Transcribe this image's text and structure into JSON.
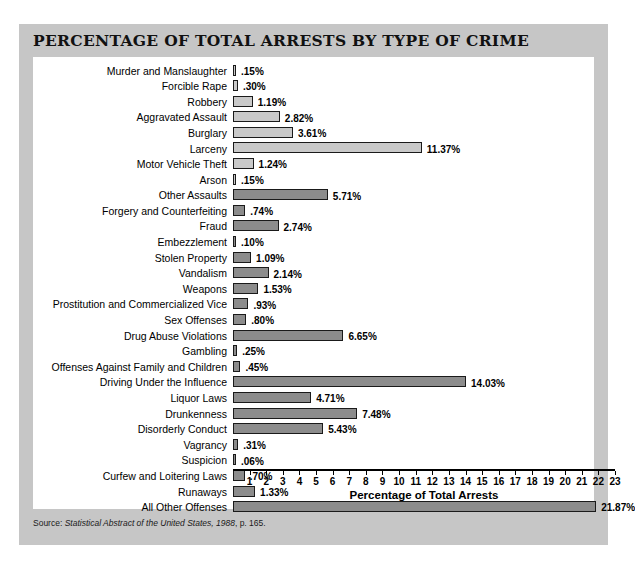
{
  "chart_title": "PERCENTAGE OF TOTAL ARRESTS BY TYPE OF CRIME",
  "source": {
    "prefix": "Source: ",
    "italic": "Statistical Abstract of the United States, 1988",
    "suffix": ", p. 165."
  },
  "colors": {
    "card_background": "#c6c6c6",
    "panel_background": "#ffffff",
    "bar_light": "#c9c9c9",
    "bar_dark": "#8c8c8c",
    "bar_outline": "#1a1a1a",
    "text": "#000000"
  },
  "chart_data": {
    "type": "bar",
    "orientation": "horizontal",
    "title": "PERCENTAGE OF TOTAL ARRESTS BY TYPE OF CRIME",
    "xlabel": "Percentage of Total Arrests",
    "ylabel": "",
    "xlim": [
      0,
      23
    ],
    "grid": false,
    "legend": "none",
    "xticks": [
      1,
      2,
      3,
      4,
      5,
      6,
      7,
      8,
      9,
      10,
      11,
      12,
      13,
      14,
      15,
      16,
      17,
      18,
      19,
      20,
      21,
      22,
      23
    ],
    "categories": [
      "Murder and Manslaughter",
      "Forcible Rape",
      "Robbery",
      "Aggravated Assault",
      "Burglary",
      "Larceny",
      "Motor Vehicle Theft",
      "Arson",
      "Other Assaults",
      "Forgery and Counterfeiting",
      "Fraud",
      "Embezzlement",
      "Stolen Property",
      "Vandalism",
      "Weapons",
      "Prostitution and Commercialized Vice",
      "Sex Offenses",
      "Drug Abuse Violations",
      "Gambling",
      "Offenses Against Family and Children",
      "Driving Under the Influence",
      "Liquor Laws",
      "Drunkenness",
      "Disorderly Conduct",
      "Vagrancy",
      "Suspicion",
      "Curfew and Loitering Laws",
      "Runaways",
      "All Other Offenses"
    ],
    "values": [
      0.15,
      0.3,
      1.19,
      2.82,
      3.61,
      11.37,
      1.24,
      0.15,
      5.71,
      0.74,
      2.74,
      0.1,
      1.09,
      2.14,
      1.53,
      0.93,
      0.8,
      6.65,
      0.25,
      0.45,
      14.03,
      4.71,
      7.48,
      5.43,
      0.31,
      0.06,
      0.7,
      1.33,
      21.87
    ],
    "value_labels": [
      ".15%",
      ".30%",
      "1.19%",
      "2.82%",
      "3.61%",
      "11.37%",
      "1.24%",
      ".15%",
      "5.71%",
      ".74%",
      "2.74%",
      ".10%",
      "1.09%",
      "2.14%",
      "1.53%",
      ".93%",
      ".80%",
      "6.65%",
      ".25%",
      ".45%",
      "14.03%",
      "4.71%",
      "7.48%",
      "5.43%",
      ".31%",
      ".06%",
      ".70%",
      "1.33%",
      "21.87%"
    ],
    "bar_styles": [
      "light",
      "light",
      "light",
      "light",
      "light",
      "light",
      "light",
      "light",
      "dark",
      "dark",
      "dark",
      "dark",
      "dark",
      "dark",
      "dark",
      "dark",
      "dark",
      "dark",
      "dark",
      "dark",
      "dark",
      "dark",
      "dark",
      "dark",
      "dark",
      "dark",
      "dark",
      "dark",
      "dark"
    ]
  }
}
